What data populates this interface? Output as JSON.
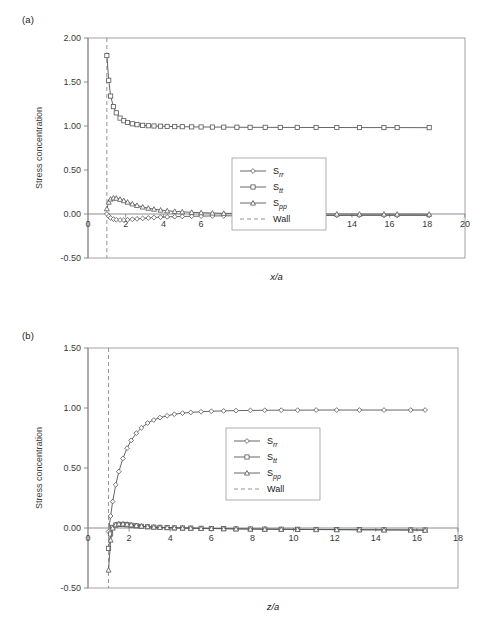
{
  "figure": {
    "panels": [
      {
        "label": "(a)",
        "xlabel": "x/a",
        "ylabel": "Stress concentration"
      },
      {
        "label": "(b)",
        "xlabel": "z/a",
        "ylabel": "Stress concentration"
      }
    ]
  },
  "chart_data": [
    {
      "type": "line",
      "title": "(a)",
      "xlabel": "x/a",
      "ylabel": "Stress concentration",
      "xlim": [
        0,
        20
      ],
      "ylim": [
        -0.5,
        2.0
      ],
      "xticks": [
        0,
        2,
        4,
        6,
        8,
        10,
        12,
        14,
        16,
        18,
        20
      ],
      "xtick_labels": [
        "0",
        "2",
        "4",
        "6",
        "8",
        "10",
        "12",
        "14",
        "16",
        "18",
        "20"
      ],
      "yticks": [
        -0.5,
        0.0,
        0.5,
        1.0,
        1.5,
        2.0
      ],
      "ytick_labels": [
        "-0.50",
        "0.00",
        "0.50",
        "1.00",
        "1.50",
        "2.00"
      ],
      "grid": false,
      "legend_position": "center",
      "legend": [
        "S_rr",
        "S_tt",
        "S_pp",
        "Wall"
      ],
      "annotations": [
        {
          "text": "Wall",
          "type": "vline",
          "x": 1.0,
          "style": "dashed"
        }
      ],
      "series": [
        {
          "name": "S_rr",
          "marker": "diamond",
          "x": [
            1.0,
            1.1,
            1.2,
            1.35,
            1.5,
            1.7,
            1.9,
            2.1,
            2.35,
            2.6,
            2.9,
            3.2,
            3.5,
            3.85,
            4.2,
            4.6,
            5.0,
            5.5,
            6.0,
            6.6,
            7.2,
            7.9,
            8.6,
            9.4,
            10.2,
            11.1,
            12.1,
            13.2,
            14.4,
            15.7,
            16.4,
            18.1
          ],
          "y": [
            0.0,
            -0.025,
            -0.045,
            -0.058,
            -0.065,
            -0.068,
            -0.068,
            -0.065,
            -0.06,
            -0.055,
            -0.05,
            -0.045,
            -0.04,
            -0.036,
            -0.033,
            -0.03,
            -0.028,
            -0.026,
            -0.024,
            -0.022,
            -0.021,
            -0.02,
            -0.019,
            -0.018,
            -0.018,
            -0.017,
            -0.017,
            -0.017,
            -0.016,
            -0.016,
            -0.016,
            -0.016
          ]
        },
        {
          "name": "S_tt",
          "marker": "square",
          "x": [
            1.0,
            1.1,
            1.2,
            1.35,
            1.5,
            1.7,
            1.9,
            2.1,
            2.35,
            2.6,
            2.9,
            3.2,
            3.5,
            3.85,
            4.2,
            4.6,
            5.0,
            5.5,
            6.0,
            6.6,
            7.2,
            7.9,
            8.6,
            9.4,
            10.2,
            11.1,
            12.1,
            13.2,
            14.4,
            15.7,
            16.4,
            18.1
          ],
          "y": [
            1.8,
            1.52,
            1.34,
            1.22,
            1.15,
            1.09,
            1.06,
            1.04,
            1.025,
            1.015,
            1.008,
            1.003,
            1.0,
            0.998,
            0.995,
            0.993,
            0.992,
            0.99,
            0.989,
            0.988,
            0.987,
            0.986,
            0.985,
            0.985,
            0.984,
            0.984,
            0.983,
            0.983,
            0.982,
            0.982,
            0.982,
            0.981
          ]
        },
        {
          "name": "S_pp",
          "marker": "triangle",
          "x": [
            1.0,
            1.1,
            1.2,
            1.35,
            1.5,
            1.7,
            1.9,
            2.1,
            2.35,
            2.6,
            2.9,
            3.2,
            3.5,
            3.85,
            4.2,
            4.6,
            5.0,
            5.5,
            6.0,
            6.6,
            7.2,
            7.9,
            8.6,
            9.4,
            10.2,
            11.1,
            12.1,
            13.2,
            14.4,
            15.7,
            16.4,
            18.1
          ],
          "y": [
            0.06,
            0.135,
            0.17,
            0.183,
            0.18,
            0.168,
            0.152,
            0.135,
            0.115,
            0.098,
            0.08,
            0.066,
            0.055,
            0.045,
            0.037,
            0.03,
            0.025,
            0.019,
            0.015,
            0.011,
            0.008,
            0.006,
            0.004,
            0.003,
            0.002,
            0.001,
            0.0,
            0.0,
            -0.001,
            -0.001,
            -0.001,
            -0.002
          ]
        }
      ]
    },
    {
      "type": "line",
      "title": "(b)",
      "xlabel": "z/a",
      "ylabel": "Stress concentration",
      "xlim": [
        0,
        18
      ],
      "ylim": [
        -0.5,
        1.5
      ],
      "xticks": [
        0,
        2,
        4,
        6,
        8,
        10,
        12,
        14,
        16,
        18
      ],
      "xtick_labels": [
        "0",
        "2",
        "4",
        "6",
        "8",
        "10",
        "12",
        "14",
        "16",
        "18"
      ],
      "yticks": [
        -0.5,
        0.0,
        0.5,
        1.0,
        1.5
      ],
      "ytick_labels": [
        "-0.50",
        "0.00",
        "0.50",
        "1.00",
        "1.50"
      ],
      "grid": false,
      "legend_position": "center",
      "legend": [
        "S_rr",
        "S_tt",
        "S_pp",
        "Wall"
      ],
      "annotations": [
        {
          "text": "Wall",
          "type": "vline",
          "x": 1.0,
          "style": "dashed"
        }
      ],
      "series": [
        {
          "name": "S_rr",
          "marker": "diamond",
          "x": [
            1.0,
            1.1,
            1.2,
            1.35,
            1.5,
            1.7,
            1.9,
            2.1,
            2.35,
            2.6,
            2.9,
            3.2,
            3.5,
            3.85,
            4.2,
            4.6,
            5.0,
            5.5,
            6.0,
            6.6,
            7.2,
            7.9,
            8.6,
            9.4,
            10.2,
            11.1,
            12.1,
            13.2,
            14.4,
            15.7,
            16.4
          ],
          "y": [
            -0.03,
            0.1,
            0.22,
            0.36,
            0.47,
            0.58,
            0.665,
            0.73,
            0.79,
            0.835,
            0.875,
            0.9,
            0.92,
            0.935,
            0.948,
            0.957,
            0.963,
            0.969,
            0.973,
            0.976,
            0.978,
            0.98,
            0.981,
            0.982,
            0.982,
            0.983,
            0.983,
            0.983,
            0.983,
            0.983,
            0.983
          ]
        },
        {
          "name": "S_tt",
          "marker": "square",
          "x": [
            1.0,
            1.1,
            1.2,
            1.35,
            1.5,
            1.7,
            1.9,
            2.1,
            2.35,
            2.6,
            2.9,
            3.2,
            3.5,
            3.85,
            4.2,
            4.6,
            5.0,
            5.5,
            6.0,
            6.6,
            7.2,
            7.9,
            8.6,
            9.4,
            10.2,
            11.1,
            12.1,
            13.2,
            14.4,
            15.7,
            16.4
          ],
          "y": [
            -0.17,
            -0.05,
            0.005,
            0.025,
            0.03,
            0.03,
            0.027,
            0.023,
            0.018,
            0.014,
            0.01,
            0.007,
            0.005,
            0.003,
            0.001,
            0.0,
            -0.001,
            -0.003,
            -0.004,
            -0.005,
            -0.007,
            -0.008,
            -0.009,
            -0.01,
            -0.011,
            -0.012,
            -0.013,
            -0.014,
            -0.015,
            -0.016,
            -0.017
          ]
        },
        {
          "name": "S_pp",
          "marker": "triangle",
          "x": [
            1.0,
            1.1,
            1.2,
            1.35,
            1.5,
            1.7,
            1.9,
            2.1,
            2.35,
            2.6,
            2.9,
            3.2,
            3.5,
            3.85,
            4.2,
            4.6,
            5.0,
            5.5,
            6.0,
            6.6,
            7.2,
            7.9,
            8.6,
            9.4,
            10.2,
            11.1,
            12.1,
            13.2,
            14.4,
            15.7,
            16.4
          ],
          "y": [
            -0.35,
            -0.1,
            0.0,
            0.028,
            0.035,
            0.035,
            0.032,
            0.027,
            0.021,
            0.016,
            0.012,
            0.008,
            0.006,
            0.004,
            0.002,
            0.0,
            -0.001,
            -0.003,
            -0.004,
            -0.006,
            -0.007,
            -0.009,
            -0.01,
            -0.011,
            -0.012,
            -0.013,
            -0.014,
            -0.015,
            -0.016,
            -0.017,
            -0.018
          ]
        }
      ]
    }
  ],
  "legend_labels": {
    "srr_base": "S",
    "srr_sub": "rr",
    "stt_base": "S",
    "stt_sub": "tt",
    "spp_base": "S",
    "spp_sub": "pp",
    "wall": "Wall"
  },
  "colors": {
    "line": "#555555",
    "axis": "#808080",
    "frame": "#999999",
    "text": "#1a1a1a",
    "wall": "#888888"
  }
}
